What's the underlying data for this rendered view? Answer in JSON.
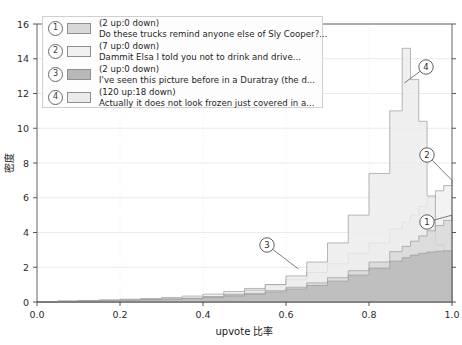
{
  "chart_data": {
    "type": "area",
    "title": "",
    "xlabel": "upvote 比率",
    "ylabel": "密度",
    "xlim": [
      0.0,
      1.0
    ],
    "ylim": [
      0.0,
      16.0
    ],
    "grid": true,
    "legend_position": "upper-left",
    "xticks": [
      "0.0",
      "0.2",
      "0.4",
      "0.6",
      "0.8",
      "1.0"
    ],
    "xtick_values": [
      0.0,
      0.2,
      0.4,
      0.6,
      0.8,
      1.0
    ],
    "yticks": [
      "0",
      "2",
      "4",
      "6",
      "8",
      "10",
      "12",
      "14",
      "16"
    ],
    "ytick_values": [
      0,
      2,
      4,
      6,
      8,
      10,
      12,
      14,
      16
    ],
    "x": [
      0.0,
      0.05,
      0.1,
      0.15,
      0.2,
      0.25,
      0.3,
      0.35,
      0.4,
      0.45,
      0.5,
      0.55,
      0.6,
      0.65,
      0.7,
      0.75,
      0.8,
      0.85,
      0.88,
      0.9,
      0.92,
      0.94,
      0.96,
      0.98,
      1.0
    ],
    "series": [
      {
        "name": "1",
        "label": "(2 up:0 down)",
        "text": "Do these trucks remind anyone else of Sly Cooper?...",
        "color": "#d8d8d8",
        "values": [
          0.0,
          0.05,
          0.08,
          0.1,
          0.12,
          0.15,
          0.18,
          0.22,
          0.3,
          0.4,
          0.5,
          0.65,
          0.85,
          1.1,
          1.4,
          1.8,
          2.3,
          2.9,
          3.2,
          3.5,
          3.8,
          4.1,
          4.4,
          4.7,
          5.0
        ]
      },
      {
        "name": "2",
        "label": "(7 up:0 down)",
        "text": "Dammit Elsa I told you not to drink and drive...",
        "color": "#f0f0f0",
        "values": [
          0.0,
          0.05,
          0.08,
          0.12,
          0.16,
          0.2,
          0.26,
          0.34,
          0.45,
          0.6,
          0.78,
          1.0,
          1.3,
          1.7,
          2.2,
          2.8,
          3.4,
          4.2,
          4.6,
          5.0,
          5.5,
          6.0,
          6.4,
          6.7,
          7.0
        ]
      },
      {
        "name": "3",
        "label": "(2 up:0 down)",
        "text": "I've seen this picture before in a Duratray (the d...",
        "color": "#b8b8b8",
        "values": [
          0.0,
          0.04,
          0.06,
          0.08,
          0.1,
          0.13,
          0.16,
          0.2,
          0.26,
          0.34,
          0.44,
          0.58,
          0.75,
          0.95,
          1.2,
          1.55,
          1.95,
          2.35,
          2.55,
          2.7,
          2.8,
          2.88,
          2.92,
          2.95,
          2.95
        ]
      },
      {
        "name": "4",
        "label": "(120 up:18 down)",
        "text": "Actually it does not look frozen just covered in a...",
        "color": "#ebebeb",
        "values": [
          0.0,
          0.02,
          0.03,
          0.05,
          0.07,
          0.1,
          0.14,
          0.2,
          0.3,
          0.45,
          0.68,
          1.0,
          1.5,
          2.3,
          3.4,
          5.0,
          7.4,
          11.0,
          14.6,
          12.8,
          10.4,
          6.1,
          3.3,
          1.6,
          0.6
        ]
      }
    ],
    "annotations": [
      {
        "label": "1",
        "x": 1.0,
        "y": 5.0,
        "cx": 427,
        "cy": 222
      },
      {
        "label": "2",
        "x": 1.0,
        "y": 7.0,
        "cx": 427,
        "cy": 155
      },
      {
        "label": "3",
        "x": 0.63,
        "y": 1.9,
        "cx": 267,
        "cy": 245
      },
      {
        "label": "4",
        "x": 0.885,
        "y": 12.6,
        "cx": 426,
        "cy": 67
      }
    ]
  },
  "legend": {
    "items": [
      {
        "num": "1",
        "line1": "(2 up:0 down)",
        "line2": "Do these trucks remind anyone else of Sly Cooper?...",
        "swatch": "#d8d8d8"
      },
      {
        "num": "2",
        "line1": "(7 up:0 down)",
        "line2": "Dammit Elsa I told you not to drink and drive...",
        "swatch": "#f0f0f0"
      },
      {
        "num": "3",
        "line1": "(2 up:0 down)",
        "line2": "I've seen this picture before in a Duratray (the d...",
        "swatch": "#b8b8b8"
      },
      {
        "num": "4",
        "line1": "(120 up:18 down)",
        "line2": "Actually it does not look frozen just covered in a...",
        "swatch": "#ebebeb"
      }
    ]
  }
}
